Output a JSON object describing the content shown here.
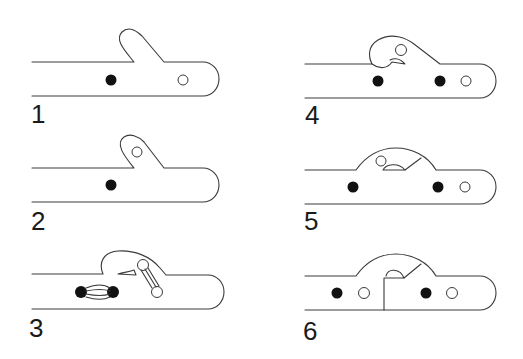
{
  "diagram": {
    "type": "sequence of six mechanism stages",
    "panels": [
      {
        "label": "1",
        "description": "bar with upward hook, one filled pin, one open hole at rounded end"
      },
      {
        "label": "2",
        "description": "hook with open hole, one filled pin"
      },
      {
        "label": "3",
        "description": "curled hook with linked pins (bundled strands) between filled pins and between open holes"
      },
      {
        "label": "4",
        "description": "curled hook with open hole and small notch, two filled pins and one open hole"
      },
      {
        "label": "5",
        "description": "arched dome with open hole and notch, two filled pins and one open hole"
      },
      {
        "label": "6",
        "description": "arched dome split by vertical seam, two filled pins and two open holes"
      }
    ]
  },
  "colors": {
    "stroke": "#3a3a3a",
    "pin": "#111111",
    "background": "#ffffff"
  }
}
